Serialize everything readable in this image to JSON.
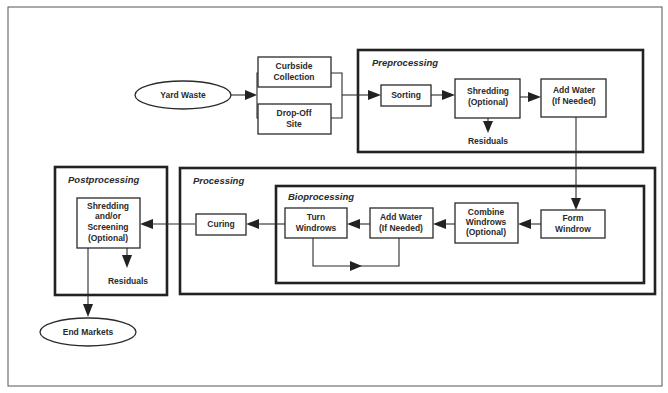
{
  "diagram": {
    "type": "flowchart",
    "groups": {
      "preprocessing": "Preprocessing",
      "processing": "Processing",
      "bioprocessing": "Bioprocessing",
      "postprocessing": "Postprocessing"
    },
    "nodes": {
      "yard_waste": [
        "Yard Waste"
      ],
      "curbside": [
        "Curbside",
        "Collection"
      ],
      "dropoff": [
        "Drop-Off",
        "Site"
      ],
      "sorting": [
        "Sorting"
      ],
      "shredding": [
        "Shredding",
        "(Optional)"
      ],
      "add_water_pre": [
        "Add Water",
        "(If Needed)"
      ],
      "residuals_pre": [
        "Residuals"
      ],
      "form_windrow": [
        "Form",
        "Windrow"
      ],
      "combine_windrows": [
        "Combine",
        "Windrows",
        "(Optional)"
      ],
      "add_water_bio": [
        "Add Water",
        "(If Needed)"
      ],
      "turn_windrows": [
        "Turn",
        "Windrows"
      ],
      "curing": [
        "Curing"
      ],
      "post_shredding": [
        "Shredding",
        "and/or",
        "Screening",
        "(Optional)"
      ],
      "residuals_post": [
        "Residuals"
      ],
      "end_markets": [
        "End Markets"
      ]
    },
    "edges": [
      [
        "Yard Waste",
        "Curbside Collection / Drop-Off Site"
      ],
      [
        "Curbside Collection / Drop-Off Site",
        "Sorting"
      ],
      [
        "Sorting",
        "Shredding (Optional)"
      ],
      [
        "Shredding (Optional)",
        "Add Water (If Needed)"
      ],
      [
        "Shredding (Optional)",
        "Residuals"
      ],
      [
        "Add Water (If Needed)",
        "Form Windrow"
      ],
      [
        "Form Windrow",
        "Combine Windrows (Optional)"
      ],
      [
        "Combine Windrows (Optional)",
        "Add Water (If Needed)"
      ],
      [
        "Add Water (If Needed)",
        "Turn Windrows"
      ],
      [
        "Turn Windrows",
        "Add Water (If Needed)"
      ],
      [
        "Turn Windrows",
        "Curing"
      ],
      [
        "Curing",
        "Shredding and/or Screening (Optional)"
      ],
      [
        "Shredding and/or Screening (Optional)",
        "Residuals"
      ],
      [
        "Shredding and/or Screening (Optional)",
        "End Markets"
      ]
    ]
  }
}
